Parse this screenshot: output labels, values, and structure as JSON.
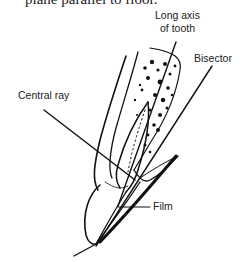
{
  "caption": "plane parallel to floor.",
  "labels": {
    "long_axis": [
      "Long axis",
      "of tooth"
    ],
    "bisector": "Bisector",
    "central_ray": "Central ray",
    "film": "Film"
  }
}
